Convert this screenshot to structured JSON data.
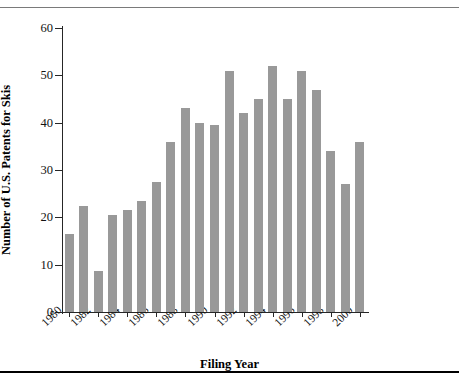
{
  "chart_data": {
    "type": "bar",
    "title": "",
    "xlabel": "Filing Year",
    "ylabel": "Number of U.S. Patents for Skis",
    "categories": [
      "1980",
      "1981",
      "1982",
      "1983",
      "1984",
      "1985",
      "1986",
      "1987",
      "1988",
      "1989",
      "1990",
      "1991",
      "1992",
      "1993",
      "1994",
      "1995",
      "1996",
      "1997",
      "1998",
      "1999",
      "2000"
    ],
    "values": [
      16.5,
      22.5,
      8.7,
      20.5,
      21.5,
      23.5,
      27.5,
      36,
      43,
      40,
      39.5,
      51,
      42,
      45,
      52,
      45,
      51,
      47,
      34,
      27,
      36
    ],
    "ylim": [
      0,
      60
    ],
    "yticks": [
      "0",
      "10",
      "20",
      "30",
      "40",
      "50",
      "60"
    ],
    "ytick_values": [
      0,
      10,
      20,
      30,
      40,
      50,
      60
    ],
    "xtick_labels": [
      "1980",
      "1982",
      "1984",
      "1986",
      "1988",
      "1990",
      "1992",
      "1994",
      "1996",
      "1998",
      "2000"
    ],
    "xtick_indices": [
      0,
      2,
      4,
      6,
      8,
      10,
      12,
      14,
      16,
      18,
      20
    ],
    "grid": false,
    "legend": false,
    "bar_color": "#999999",
    "axis_color": "#262626",
    "text_color": "#121212"
  }
}
